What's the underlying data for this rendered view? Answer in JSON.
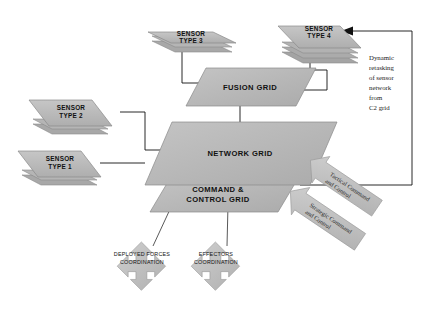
{
  "diagram": {
    "background_color": "#ffffff",
    "shape_fill": "#b3b3b3",
    "shape_fill_light": "#c2c2c2",
    "shape_stroke": "#8a8a8a",
    "line_color": "#111111"
  },
  "sensors": [
    {
      "id": "sensor-type-1",
      "line1": "SENSOR",
      "line2": "TYPE 1",
      "layers": 2
    },
    {
      "id": "sensor-type-2",
      "line1": "SENSOR",
      "line2": "TYPE 2",
      "layers": 2
    },
    {
      "id": "sensor-type-3",
      "line1": "SENSOR",
      "line2": "TYPE 3",
      "layers": 2
    },
    {
      "id": "sensor-type-4",
      "line1": "SENSOR",
      "line2": "TYPE 4",
      "layers": 4
    }
  ],
  "grids": {
    "fusion": {
      "label": "FUSION GRID"
    },
    "network": {
      "label": "NETWORK GRID"
    },
    "command_control": {
      "line1": "COMMAND &",
      "line2": "CONTROL GRID"
    }
  },
  "coordination": [
    {
      "id": "deployed-forces",
      "line1": "DEPLOYED FORCES",
      "line2": "COORDINATION"
    },
    {
      "id": "effectors",
      "line1": "EFFECTORS",
      "line2": "COORDINATION"
    }
  ],
  "command_inputs": [
    {
      "id": "tactical-command",
      "line1": "Tactical Command",
      "line2": "and Control"
    },
    {
      "id": "strategic-command",
      "line1": "Strategic Command",
      "line2": "and Control"
    }
  ],
  "annotation": {
    "lines": [
      "Dynamic",
      "retasking",
      "of sensor",
      "network",
      "from",
      "C2 grid"
    ],
    "line_0": "Dynamic",
    "line_1": "retasking",
    "line_2": "of sensor",
    "line_3": "network",
    "line_4": "from",
    "line_5": "C2 grid"
  }
}
